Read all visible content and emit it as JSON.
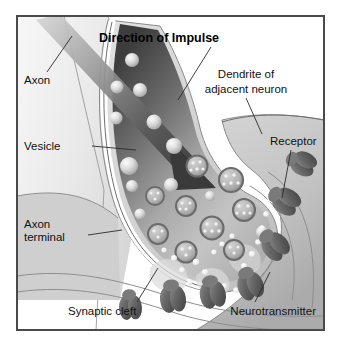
{
  "figure": {
    "title": "Direction of Impulse",
    "frame": {
      "border_color": "#4a4a4a",
      "background_color": "#ffffff",
      "outer_margin_color": "#ffffff"
    },
    "palette": {
      "ink": "#111111",
      "outline": "#2b2b2b",
      "dark_cytoplasm": "#3a3a3a",
      "mid_cytoplasm": "#b8b8b8",
      "light_cytoplasm": "#dcdcdc",
      "axon_fill": "#ededed",
      "dendrite_fill": "#c8c8c8",
      "membrane_white": "#ffffff",
      "receptor_dark": "#5c5c5c",
      "receptor_light": "#9a9a9a",
      "vesicle_fill": "#d8d8d8",
      "transmitter_dot": "#f2f2f2"
    },
    "labels": [
      {
        "id": "direction-of-impulse",
        "text": "Direction of Impulse",
        "bold": true,
        "lines": [
          "Direction of Impulse"
        ]
      },
      {
        "id": "axon",
        "text": "Axon",
        "bold": false,
        "lines": [
          "Axon"
        ]
      },
      {
        "id": "vesicle",
        "text": "Vesicle",
        "bold": false,
        "lines": [
          "Vesicle"
        ]
      },
      {
        "id": "axon-terminal",
        "text": "Axon terminal",
        "bold": false,
        "lines": [
          "Axon",
          "terminal"
        ]
      },
      {
        "id": "dendrite-of-adjacent-neuron",
        "text": "Dendrite of adjacent neuron",
        "bold": false,
        "lines": [
          "Dendrite of",
          "adjacent neuron"
        ]
      },
      {
        "id": "receptor",
        "text": "Receptor",
        "bold": false,
        "lines": [
          "Receptor"
        ]
      },
      {
        "id": "synaptic-cleft",
        "text": "Synaptic cleft",
        "bold": false,
        "lines": [
          "Synaptic cleft"
        ]
      },
      {
        "id": "neurotransmitter",
        "text": "Neurotransmitter",
        "bold": false,
        "lines": [
          "Neurotransmitter"
        ]
      }
    ],
    "label_text": {
      "title": "Direction of Impulse",
      "axon": "Axon",
      "vesicle": "Vesicle",
      "axon_terminal_line1": "Axon",
      "axon_terminal_line2": "terminal",
      "dendrite_line1": "Dendrite of",
      "dendrite_line2": "adjacent neuron",
      "receptor": "Receptor",
      "synaptic_cleft": "Synaptic cleft",
      "neurotransmitter": "Neurotransmitter"
    },
    "structures": [
      {
        "name": "axon",
        "description": "pale band entering from upper left"
      },
      {
        "name": "axon-terminal",
        "description": "bulb-shaped presynaptic ending with gradient cytoplasm"
      },
      {
        "name": "synaptic-vesicle",
        "count": 22,
        "description": "spheres, some ringed with granules inside"
      },
      {
        "name": "neurotransmitter-dot",
        "count": 18,
        "description": "small pale dots crossing the cleft"
      },
      {
        "name": "receptor",
        "count": 7,
        "description": "dark barrel shapes on the dendrite membrane"
      },
      {
        "name": "synaptic-cleft",
        "description": "gap between terminal membrane and dendrite"
      },
      {
        "name": "dendrite",
        "description": "postsynaptic neuron surface at right"
      },
      {
        "name": "impulse-arrow",
        "description": "thick tapering arrow aimed down-right into the terminal"
      }
    ]
  }
}
